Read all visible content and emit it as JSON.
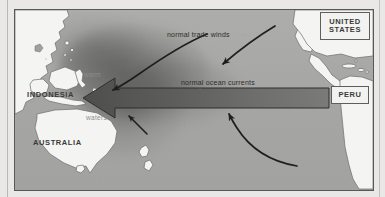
{
  "figure": {
    "title_alt": "Normal (non-El Nino) Pacific Ocean conditions diagram",
    "background_color": "#e9e8e6",
    "ocean_color": "#a9a9a7",
    "land_color": "#f4f4f2",
    "ink_color": "#2e2e2c",
    "warm_pool_color": "#4b4b49"
  },
  "labels": {
    "indonesia": "INDONESIA",
    "australia": "AUSTRALIA",
    "united_states_line1": "UNITED",
    "united_states_line2": "STATES",
    "peru": "PERU",
    "warm": "warm",
    "waters": "waters",
    "trade_winds": "normal trade winds",
    "ocean_currents": "normal ocean currents"
  },
  "arrows": [
    {
      "name": "trade-winds-arrow-north",
      "label": "normal trade winds",
      "direction": "east-to-west",
      "style": "thin-curved"
    },
    {
      "name": "trade-winds-arrow-east",
      "label": "",
      "direction": "east-to-west",
      "style": "thin-curved"
    },
    {
      "name": "ocean-current-block-arrow",
      "label": "normal ocean currents",
      "direction": "east-to-west",
      "style": "block"
    },
    {
      "name": "upwelling-arrow-south",
      "label": "",
      "direction": "south-to-north",
      "style": "thin-curved"
    },
    {
      "name": "warm-water-arrow-indonesia",
      "label": "",
      "direction": "east-to-west",
      "style": "thin-curved"
    }
  ]
}
